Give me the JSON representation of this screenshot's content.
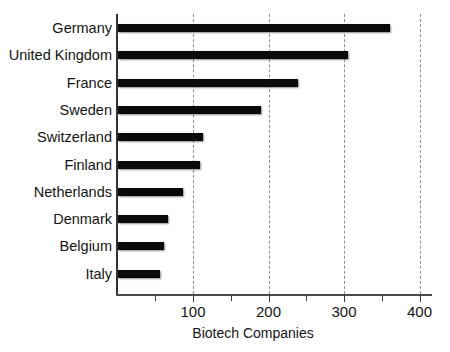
{
  "chart_data": {
    "type": "bar",
    "orientation": "horizontal",
    "title": "",
    "xlabel": "Biotech Companies",
    "ylabel": "",
    "categories": [
      "Germany",
      "United Kingdom",
      "France",
      "Sweden",
      "Switzerland",
      "Finland",
      "Netherlands",
      "Denmark",
      "Belgium",
      "Italy"
    ],
    "values": [
      360,
      305,
      238,
      190,
      113,
      108,
      86,
      66,
      61,
      55
    ],
    "xlim": [
      0,
      420
    ],
    "xticks": [
      100,
      200,
      300,
      400
    ],
    "xtick_labels": [
      "100",
      "200",
      "300",
      "400"
    ],
    "xticks_minor": [
      50,
      150,
      250,
      350
    ],
    "grid": "vertical-dashed",
    "legend": "none",
    "bar_color": "#0a0a0a",
    "background_color": "#ffffff"
  },
  "axis": {
    "x_title": "Biotech Companies"
  }
}
